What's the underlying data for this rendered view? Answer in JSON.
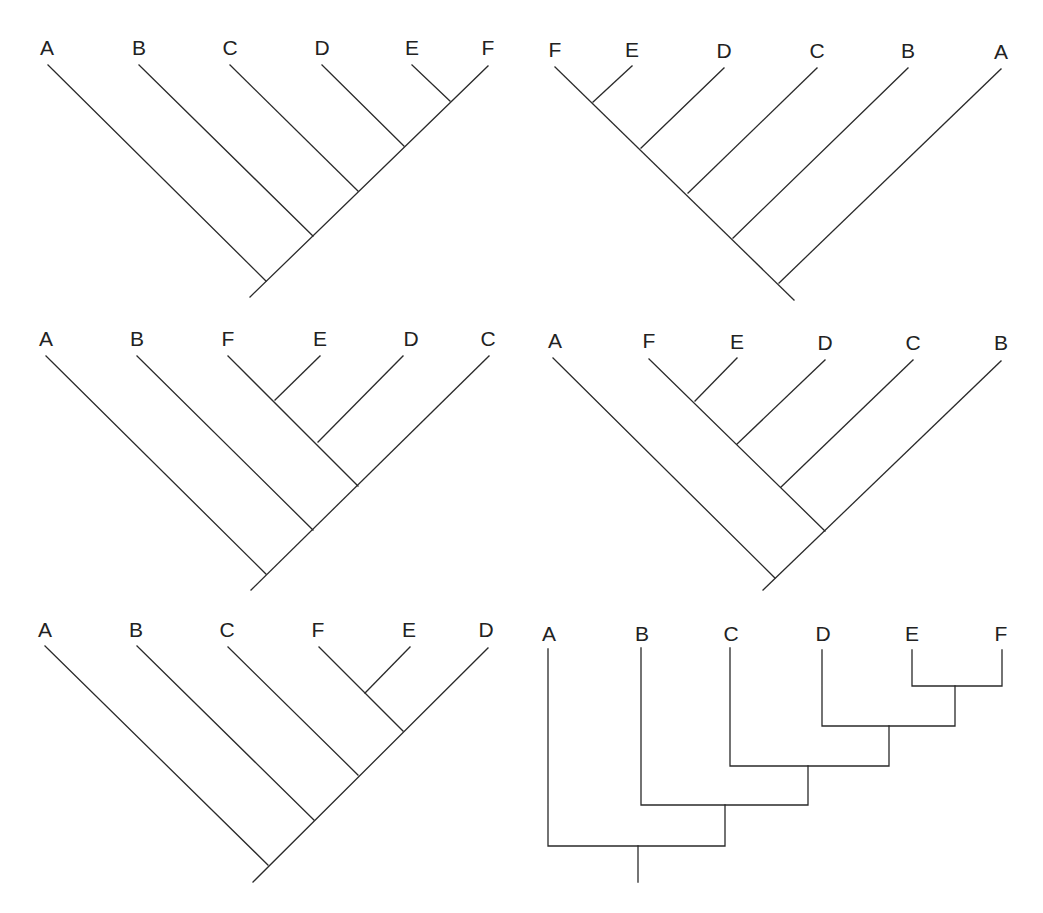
{
  "figure": {
    "line_color": "#2a2a2a",
    "label_color": "#222222"
  },
  "trees": [
    {
      "id": "tree-1",
      "style": "diagonal",
      "tip_order": [
        "A",
        "B",
        "C",
        "D",
        "E",
        "F"
      ],
      "topology": "(A,(B,(C,(D,(E,F)))))"
    },
    {
      "id": "tree-2",
      "style": "diagonal",
      "tip_order": [
        "F",
        "E",
        "D",
        "C",
        "B",
        "A"
      ],
      "topology": "((((F,E),D),C),B),A"
    },
    {
      "id": "tree-3",
      "style": "diagonal",
      "tip_order": [
        "A",
        "B",
        "F",
        "E",
        "D",
        "C"
      ],
      "topology": "(A,(B,(((F,E),D),C)))"
    },
    {
      "id": "tree-4",
      "style": "diagonal",
      "tip_order": [
        "A",
        "F",
        "E",
        "D",
        "C",
        "B"
      ],
      "topology": "(A,((((F,E),D),C),B))"
    },
    {
      "id": "tree-5",
      "style": "diagonal",
      "tip_order": [
        "A",
        "B",
        "C",
        "F",
        "E",
        "D"
      ],
      "topology": "(A,(B,(C,((F,E),D))))"
    },
    {
      "id": "tree-6",
      "style": "rectangular",
      "tip_order": [
        "A",
        "B",
        "C",
        "D",
        "E",
        "F"
      ],
      "topology": "(A,(B,(C,(D,(E,F)))))"
    }
  ]
}
